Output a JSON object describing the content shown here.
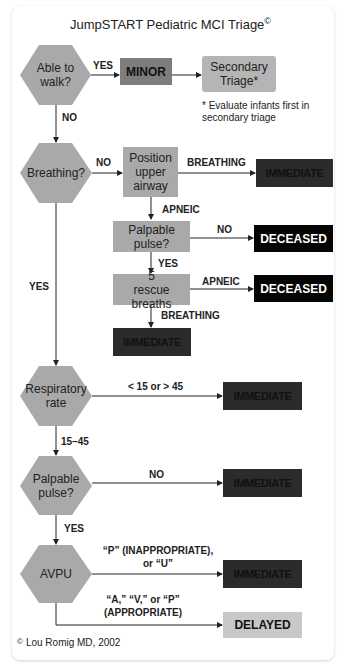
{
  "title": "JumpSTART Pediatric MCI Triage",
  "title_mark": "©",
  "nodes": {
    "able_to_walk": "Able to walk?",
    "minor": "MINOR",
    "secondary_triage": "Secondary Triage*",
    "footnote": "* Evaluate infants first in secondary triage",
    "breathing": "Breathing?",
    "position_airway": "Position upper airway",
    "immediate_1": "IMMEDIATE",
    "palpable_pulse_box": "Palpable pulse?",
    "deceased_1": "DECEASED",
    "rescue_breaths": "5 rescue breaths",
    "deceased_2": "DECEASED",
    "immediate_2": "IMMEDIATE",
    "respiratory_rate": "Respiratory rate",
    "immediate_3": "IMMEDIATE",
    "palpable_pulse_hex": "Palpable pulse?",
    "immediate_4": "IMMEDIATE",
    "avpu": "AVPU",
    "immediate_5": "IMMEDIATE",
    "delayed": "DELAYED"
  },
  "edges": {
    "walk_yes": "YES",
    "walk_no": "NO",
    "breathing_no": "NO",
    "breathing_yes": "YES",
    "airway_breathing": "BREATHING",
    "airway_apneic": "APNEIC",
    "pulse_no": "NO",
    "pulse_yes": "YES",
    "rescue_apneic": "APNEIC",
    "rescue_breathing": "BREATHING",
    "rate_abnormal": "< 15 or > 45",
    "rate_normal": "15–45",
    "hex_pulse_no": "NO",
    "hex_pulse_yes": "YES",
    "avpu_bad_1": "“P” (INAPPROPRIATE),",
    "avpu_bad_2": "or “U”",
    "avpu_good_1": "“A,” “V,” or “P”",
    "avpu_good_2": "(APPROPRIATE)"
  },
  "footer": {
    "mark": "©",
    "text": "Lou Romig MD, 2002"
  },
  "colors": {
    "hexagon": "#a9a9a9",
    "minor": "#7d7d7d",
    "immediate": "#2b2b2b",
    "deceased": "#050505",
    "delayed": "#c8c8c8"
  }
}
